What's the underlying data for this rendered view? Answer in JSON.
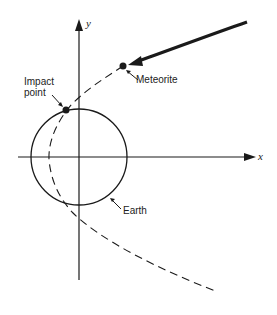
{
  "diagram": {
    "labels": {
      "y_axis": "y",
      "x_axis": "x",
      "meteorite": "Meteorite",
      "impact_line1": "Impact",
      "impact_line2": "point",
      "earth": "Earth"
    },
    "colors": {
      "ink": "#1a1a1a",
      "background": "#ffffff"
    }
  }
}
